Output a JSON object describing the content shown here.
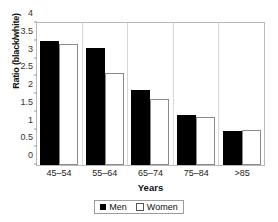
{
  "chart_data": {
    "type": "bar",
    "title": "",
    "xlabel": "Years",
    "ylabel": "Ratio (black/white)",
    "categories": [
      "45–54",
      "55–64",
      "65–74",
      "75–84",
      ">85"
    ],
    "series": [
      {
        "name": "Men",
        "values": [
          3.5,
          3.3,
          2.1,
          1.42,
          0.95
        ],
        "color": "#000000",
        "fill": "solid"
      },
      {
        "name": "Women",
        "values": [
          3.4,
          2.6,
          1.85,
          1.35,
          0.98
        ],
        "color": "#ffffff",
        "fill": "open"
      }
    ],
    "ylim": [
      0,
      4
    ],
    "yticks": [
      "0",
      "0.5",
      "1",
      "1.5",
      "2",
      "2.5",
      "3",
      "3.5",
      "4"
    ],
    "ytick_values": [
      0,
      0.5,
      1,
      1.5,
      2,
      2.5,
      3,
      3.5,
      4
    ],
    "grid": false,
    "legend_position": "bottom-center",
    "legend_entries": [
      "Men",
      "Women"
    ]
  }
}
